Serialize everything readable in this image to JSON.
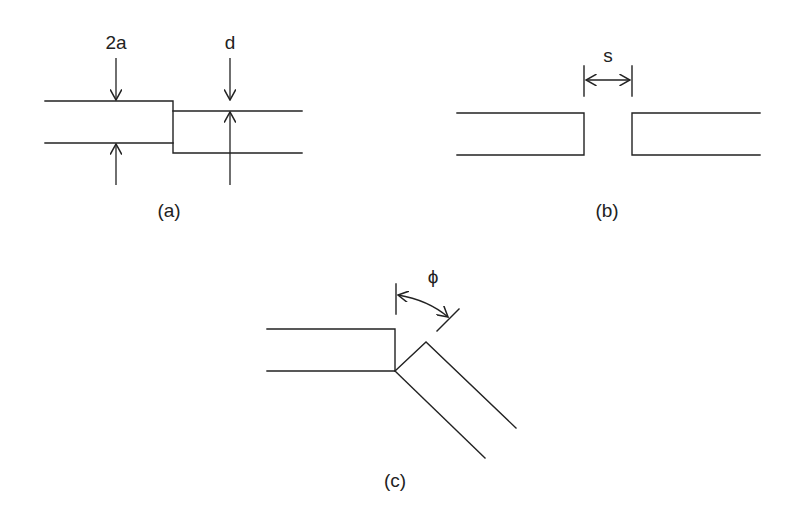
{
  "figure": {
    "panels": [
      {
        "id": "a",
        "caption": "(a)",
        "description": "Step discontinuity between two parallel-plate waveguides",
        "labels": {
          "width_label": "2a",
          "offset_label": "d"
        }
      },
      {
        "id": "b",
        "caption": "(b)",
        "description": "Gap between two collinear waveguides",
        "labels": {
          "gap_label": "s"
        }
      },
      {
        "id": "c",
        "caption": "(c)",
        "description": "Angular bend between two waveguides",
        "labels": {
          "angle_label": "ϕ"
        }
      }
    ],
    "line_color": "#222222",
    "background": "#ffffff"
  }
}
